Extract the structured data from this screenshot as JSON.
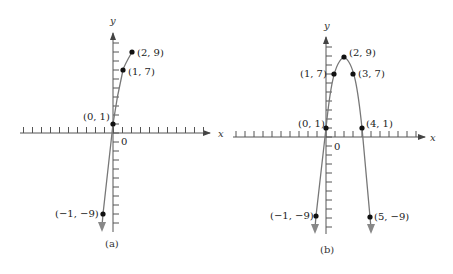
{
  "panels": [
    {
      "id": "a",
      "caption": "(a)",
      "x_axis_label": "x",
      "y_axis_label": "y",
      "origin_label": "0",
      "points": [
        {
          "x": 2,
          "y": 9,
          "label": "(2, 9)"
        },
        {
          "x": 1,
          "y": 7,
          "label": "(1, 7)"
        },
        {
          "x": 0,
          "y": 1,
          "label": "(0, 1)"
        },
        {
          "x": -1,
          "y": -9,
          "label": "(−1, −9)"
        }
      ]
    },
    {
      "id": "b",
      "caption": "(b)",
      "x_axis_label": "x",
      "y_axis_label": "y",
      "origin_label": "0",
      "points": [
        {
          "x": 2,
          "y": 9,
          "label": "(2, 9)"
        },
        {
          "x": 1,
          "y": 7,
          "label": "(1, 7)"
        },
        {
          "x": 3,
          "y": 7,
          "label": "(3, 7)"
        },
        {
          "x": 0,
          "y": 1,
          "label": "(0, 1)"
        },
        {
          "x": 4,
          "y": 1,
          "label": "(4, 1)"
        },
        {
          "x": -1,
          "y": -9,
          "label": "(−1, −9)"
        },
        {
          "x": 5,
          "y": -9,
          "label": "(5, −9)"
        }
      ]
    }
  ],
  "colors": {
    "axis": "#555555",
    "curve": "#777777",
    "point": "#111111",
    "text": "#222222"
  }
}
